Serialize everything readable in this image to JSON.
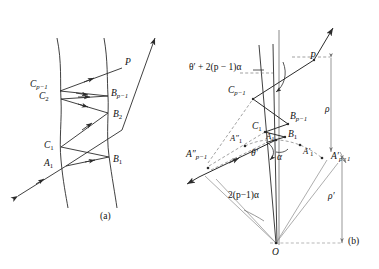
{
  "figure": {
    "captions": [
      {
        "id": "caption-a",
        "text": "(a)",
        "x": 104,
        "y": 240
      },
      {
        "id": "caption-b",
        "text": "(b)",
        "x": 349,
        "y": 248
      }
    ]
  },
  "panel_a": {
    "name": "panel-a-ray-path-between-surfaces",
    "labels": [
      {
        "name": "label-P",
        "base": "P",
        "sub": "",
        "x": 125,
        "y": 64,
        "sub_italic": false
      },
      {
        "name": "label-Cp-1",
        "base": "C",
        "sub": "p−1",
        "x": 45,
        "y": 85,
        "sub_italic": true
      },
      {
        "name": "label-C2",
        "base": "C",
        "sub": "2",
        "x": 53,
        "y": 97,
        "sub_italic": false
      },
      {
        "name": "label-Bp-1",
        "base": "B",
        "sub": "p−1",
        "x": 111,
        "y": 94,
        "sub_italic": true
      },
      {
        "name": "label-B2",
        "base": "B",
        "sub": "2",
        "x": 113,
        "y": 115,
        "sub_italic": false
      },
      {
        "name": "label-C1",
        "base": "C",
        "sub": "1",
        "x": 58,
        "y": 149,
        "sub_italic": false
      },
      {
        "name": "label-A1",
        "base": "A",
        "sub": "1",
        "x": 58,
        "y": 167,
        "sub_italic": false
      },
      {
        "name": "label-B1",
        "base": "B",
        "sub": "1",
        "x": 112,
        "y": 163,
        "sub_italic": false
      }
    ]
  },
  "panel_b": {
    "name": "panel-b-angle-construction",
    "labels": [
      {
        "name": "label-theta-expression",
        "text": "θ′ + 2(p − 1)α",
        "x": 194,
        "y": 68
      },
      {
        "name": "label-P-b",
        "base": "P",
        "sub": "",
        "x": 310,
        "y": 57,
        "sub_italic": false
      },
      {
        "name": "label-Cp-1-b",
        "base": "C",
        "sub": "p−1",
        "x": 236,
        "y": 90,
        "sub_italic": true
      },
      {
        "name": "label-Bp-1-b",
        "base": "B",
        "sub": "p−1",
        "x": 290,
        "y": 116,
        "sub_italic": true
      },
      {
        "name": "label-C1-b",
        "base": "C",
        "sub": "1",
        "x": 258,
        "y": 127,
        "sub_italic": false
      },
      {
        "name": "label-B1-b",
        "base": "B",
        "sub": "1",
        "x": 288,
        "y": 134,
        "sub_italic": false
      },
      {
        "name": "label-A1-b",
        "base": "A",
        "sub": "1",
        "x": 269,
        "y": 137,
        "sub_italic": false
      },
      {
        "name": "label-A1-dprime",
        "base": "A″",
        "sub": "1",
        "x": 234,
        "y": 139,
        "sub_italic": false
      },
      {
        "name": "label-Ap-1-dprime",
        "base": "A″",
        "sub": "p−1",
        "x": 190,
        "y": 155,
        "sub_italic": true
      },
      {
        "name": "label-A1-prime",
        "base": "A′",
        "sub": "1",
        "x": 305,
        "y": 152,
        "sub_italic": false
      },
      {
        "name": "label-Ap-1-prime",
        "base": "A′",
        "sub": "p−1",
        "x": 336,
        "y": 156,
        "sub_italic": true
      },
      {
        "name": "label-theta-prime",
        "text": "θ′",
        "x": 255,
        "y": 153
      },
      {
        "name": "label-alpha",
        "text": "α",
        "x": 279,
        "y": 157
      },
      {
        "name": "label-rho",
        "text": "ρ",
        "x": 328,
        "y": 110
      },
      {
        "name": "label-rho-prime",
        "text": "ρ′",
        "x": 331,
        "y": 196
      },
      {
        "name": "label-two-p-alpha",
        "text": "2(p−1)α",
        "x": 234,
        "y": 196
      },
      {
        "name": "label-O",
        "text": "O",
        "x": 273,
        "y": 254
      }
    ]
  },
  "colors": {
    "stroke": "#2b2b2b",
    "stroke_light": "#6b6b6b",
    "background": "#ffffff"
  }
}
